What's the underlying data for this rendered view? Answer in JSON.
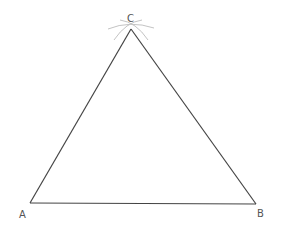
{
  "diagram": {
    "title": "",
    "vertices": [
      {
        "label": "A",
        "x": 30,
        "y": 203
      },
      {
        "label": "B",
        "x": 256,
        "y": 204
      },
      {
        "label": "C",
        "x": 131,
        "y": 29
      }
    ],
    "labels": {
      "A": "A",
      "B": "B",
      "C": "C"
    },
    "stroke_color": "#444444",
    "arc_color": "#bbbbbb"
  }
}
